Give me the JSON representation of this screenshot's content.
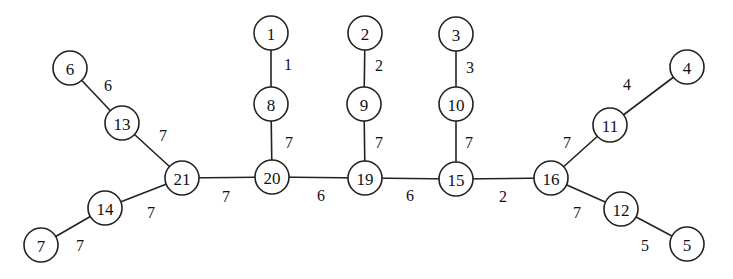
{
  "diagram": {
    "type": "weighted-tree",
    "nodes": [
      {
        "id": "1",
        "label": "1",
        "x": 271,
        "y": 33
      },
      {
        "id": "2",
        "label": "2",
        "x": 365,
        "y": 33
      },
      {
        "id": "3",
        "label": "3",
        "x": 456,
        "y": 34
      },
      {
        "id": "4",
        "label": "4",
        "x": 687,
        "y": 67
      },
      {
        "id": "5",
        "label": "5",
        "x": 687,
        "y": 244
      },
      {
        "id": "6",
        "label": "6",
        "x": 70,
        "y": 68
      },
      {
        "id": "7",
        "label": "7",
        "x": 41,
        "y": 245
      },
      {
        "id": "8",
        "label": "8",
        "x": 271,
        "y": 104
      },
      {
        "id": "9",
        "label": "9",
        "x": 364,
        "y": 104
      },
      {
        "id": "10",
        "label": "10",
        "x": 456,
        "y": 104
      },
      {
        "id": "11",
        "label": "11",
        "x": 610,
        "y": 125
      },
      {
        "id": "12",
        "label": "12",
        "x": 621,
        "y": 209
      },
      {
        "id": "13",
        "label": "13",
        "x": 122,
        "y": 123
      },
      {
        "id": "14",
        "label": "14",
        "x": 105,
        "y": 208
      },
      {
        "id": "15",
        "label": "15",
        "x": 456,
        "y": 179
      },
      {
        "id": "16",
        "label": "16",
        "x": 551,
        "y": 178
      },
      {
        "id": "19",
        "label": "19",
        "x": 365,
        "y": 178
      },
      {
        "id": "20",
        "label": "20",
        "x": 272,
        "y": 177
      },
      {
        "id": "21",
        "label": "21",
        "x": 182,
        "y": 178
      }
    ],
    "edges": [
      {
        "from": "6",
        "to": "13",
        "weight": "6",
        "lx": 108,
        "ly": 85
      },
      {
        "from": "13",
        "to": "21",
        "weight": "7",
        "lx": 163,
        "ly": 135
      },
      {
        "from": "21",
        "to": "14",
        "weight": "7",
        "lx": 151,
        "ly": 212
      },
      {
        "from": "14",
        "to": "7",
        "weight": "7",
        "lx": 80,
        "ly": 245
      },
      {
        "from": "21",
        "to": "20",
        "weight": "7",
        "lx": 226,
        "ly": 196
      },
      {
        "from": "1",
        "to": "8",
        "weight": "1",
        "lx": 288,
        "ly": 64
      },
      {
        "from": "8",
        "to": "20",
        "weight": "7",
        "lx": 289,
        "ly": 142
      },
      {
        "from": "20",
        "to": "19",
        "weight": "6",
        "lx": 321,
        "ly": 195
      },
      {
        "from": "2",
        "to": "9",
        "weight": "2",
        "lx": 379,
        "ly": 65
      },
      {
        "from": "9",
        "to": "19",
        "weight": "7",
        "lx": 379,
        "ly": 142
      },
      {
        "from": "19",
        "to": "15",
        "weight": "6",
        "lx": 410,
        "ly": 195
      },
      {
        "from": "3",
        "to": "10",
        "weight": "3",
        "lx": 470,
        "ly": 67
      },
      {
        "from": "10",
        "to": "15",
        "weight": "7",
        "lx": 469,
        "ly": 142
      },
      {
        "from": "15",
        "to": "16",
        "weight": "2",
        "lx": 503,
        "ly": 196
      },
      {
        "from": "16",
        "to": "11",
        "weight": "7",
        "lx": 567,
        "ly": 142
      },
      {
        "from": "11",
        "to": "4",
        "weight": "4",
        "lx": 627,
        "ly": 84
      },
      {
        "from": "16",
        "to": "12",
        "weight": "7",
        "lx": 577,
        "ly": 212
      },
      {
        "from": "12",
        "to": "5",
        "weight": "5",
        "lx": 645,
        "ly": 245
      }
    ]
  }
}
